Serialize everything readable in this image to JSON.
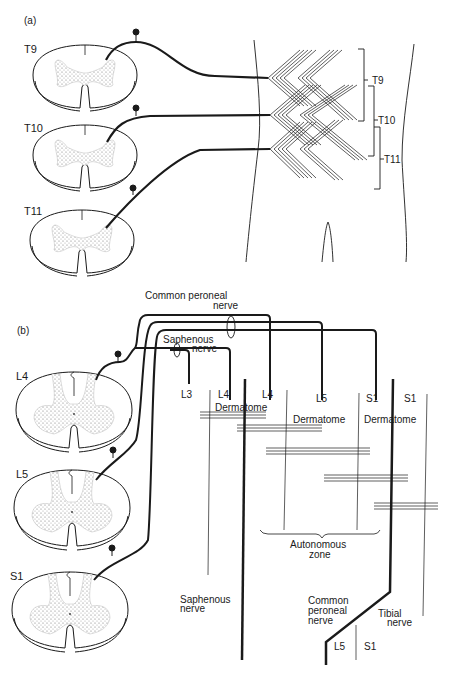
{
  "panel_a": {
    "label": "(a)",
    "segments": [
      "T9",
      "T10",
      "T11"
    ],
    "dermatome_brackets": [
      "T9",
      "T10",
      "T11"
    ]
  },
  "panel_b": {
    "label": "(b)",
    "segments": [
      "L4",
      "L5",
      "S1"
    ],
    "nerve_labels": {
      "common_peroneal_top_line1": "Common peroneal",
      "common_peroneal_top_line2": "nerve",
      "saphenous_top_line1": "Saphenous",
      "saphenous_top_line2": "nerve"
    },
    "root_labels": [
      "L3",
      "L4",
      "L4",
      "L5",
      "S1",
      "S1"
    ],
    "dermatome_word": "Dermatome",
    "autonomous_zone_line1": "Autonomous",
    "autonomous_zone_line2": "zone",
    "bottom_labels": {
      "saphenous_line1": "Saphenous",
      "saphenous_line2": "nerve",
      "common_peroneal_line1": "Common",
      "common_peroneal_line2": "peroneal",
      "common_peroneal_line3": "nerve",
      "tibial_line1": "Tibial",
      "tibial_line2": "nerve",
      "l5": "L5",
      "s1": "S1"
    }
  },
  "colors": {
    "ink": "#1a1a1a",
    "stipple": "#9a9a9a",
    "background": "#ffffff"
  }
}
